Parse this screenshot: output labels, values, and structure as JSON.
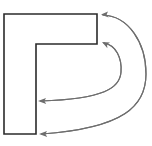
{
  "figure": {
    "background_color": "#ffffff",
    "canvas": {
      "width": 152,
      "height": 146
    },
    "shape": {
      "name": "t-shape-polygon",
      "description": "L/T shaped outline: wide horizontal bar on top, narrow vertical bar descending from its left portion",
      "stroke_color": "#2b2b2b",
      "fill_color": "#ffffff",
      "stroke_width": 1.6,
      "points": "4,14 97,14 97,44 36,44 36,134 4,134",
      "horizontal_bar": {
        "x": 4,
        "y": 14,
        "width": 93,
        "height": 30
      },
      "vertical_bar": {
        "x": 4,
        "y": 44,
        "width": 32,
        "height": 90
      }
    },
    "arrows": [
      {
        "name": "arrow-outer-top",
        "label": "",
        "stroke_color": "#6e6e6e",
        "path": "M 103 15 C 128 16 146 42 146 74 C 146 106 124 128 42 134",
        "head_x": 101,
        "head_y": 14.5,
        "head_points": "101,14.5 108,11.4 106.6,14.6 108.6,17.6"
      },
      {
        "name": "arrow-inner-top",
        "label": "",
        "stroke_color": "#6e6e6e",
        "path": "M 104 43 C 116 45 122 58 121 72 C 120 88 104 99 41 101",
        "head_x": 102,
        "head_y": 42,
        "head_points": "102,42 110,42.5 107,44.6 107.4,48.2"
      },
      {
        "name": "arrow-mid-lower",
        "label": "",
        "stroke_color": "#6e6e6e",
        "path": "M 41 101 C 104 99 120 88 121 72 C 122 58 116 45 104 43",
        "head_x": 38,
        "head_y": 101,
        "head_points": "38,101 46,98 44.4,101 46.2,104"
      },
      {
        "name": "arrow-outer-lower",
        "label": "",
        "stroke_color": "#6e6e6e",
        "path": "M 42 134 C 124 128 146 106 146 74 C 146 42 128 16 103 15",
        "head_x": 39,
        "head_y": 134,
        "head_points": "39,134 47,131 45.4,134 47.2,137"
      }
    ]
  }
}
